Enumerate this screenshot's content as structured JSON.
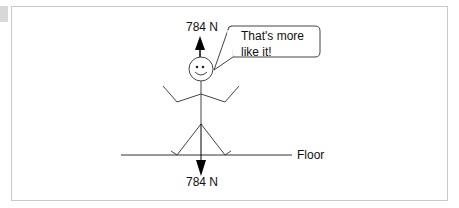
{
  "diagram": {
    "top_force_label": "784 N",
    "bottom_force_label": "784 N",
    "speech_bubble": {
      "line1": "That's more",
      "line2": "like it!"
    },
    "floor_label": "Floor",
    "colors": {
      "stroke": "#333333",
      "arrow": "#000000",
      "frame_border": "#c8c8c8"
    }
  }
}
